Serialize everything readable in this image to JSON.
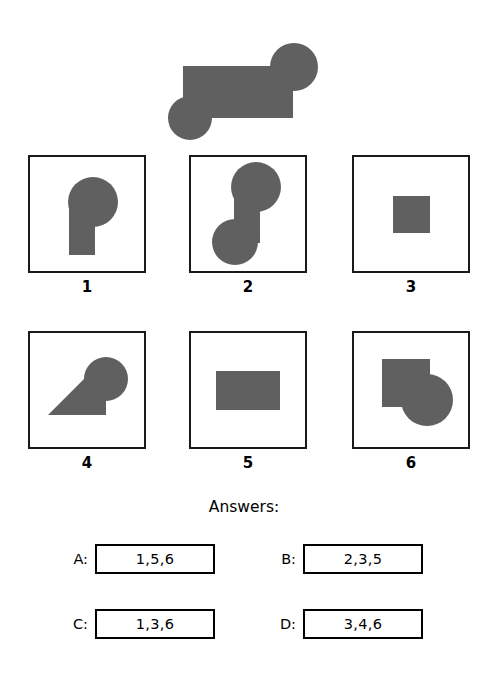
{
  "page": {
    "background_color": "#ffffff",
    "shape_fill": "#606060",
    "outline_color": "#1a1a1a"
  },
  "prompt": {
    "name": "target-composite-shape",
    "description": "large horizontal rectangle with a circle at upper-right and a circle at lower-left"
  },
  "options": [
    {
      "label": "1",
      "name": "option-1",
      "description": "circle on top-right with rectangle below-left"
    },
    {
      "label": "2",
      "name": "option-2",
      "description": "two circles joined by a vertical rectangle, offset diagonally"
    },
    {
      "label": "3",
      "name": "option-3",
      "description": "single square"
    },
    {
      "label": "4",
      "name": "option-4",
      "description": "rotated rectangle with circle, forming a triangle-like wedge"
    },
    {
      "label": "5",
      "name": "option-5",
      "description": "single horizontal rectangle"
    },
    {
      "label": "6",
      "name": "option-6",
      "description": "square with circle overlapping at lower-right"
    }
  ],
  "answers": {
    "title": "Answers:",
    "choices": [
      {
        "letter": "A:",
        "value": "1,5,6"
      },
      {
        "letter": "B:",
        "value": "2,3,5"
      },
      {
        "letter": "C:",
        "value": "1,3,6"
      },
      {
        "letter": "D:",
        "value": "3,4,6"
      }
    ]
  }
}
